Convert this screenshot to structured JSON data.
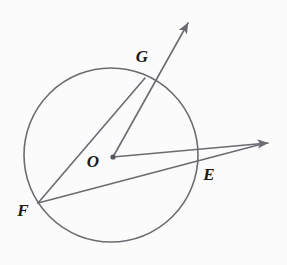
{
  "figure": {
    "kind": "geometry-diagram",
    "background_color": "#fbfbfb",
    "stroke_color": "#6b6b72",
    "label_color": "#1a1a1a",
    "width": 287,
    "height": 265
  },
  "circle": {
    "name": "circle-O",
    "center_x": 111,
    "center_y": 155,
    "radius": 87,
    "stroke_color": "#6b6b72",
    "stroke_width": 1.6,
    "fill": "none"
  },
  "points": [
    {
      "id": "O",
      "label": "O",
      "x": 113,
      "y": 157,
      "label_x": 93,
      "label_y": 161,
      "role": "center",
      "has_dot": true,
      "dot_radius": 2.6
    },
    {
      "id": "G",
      "label": "G",
      "x": 145,
      "y": 78,
      "label_x": 142,
      "label_y": 56,
      "role": "on-circle",
      "has_dot": false,
      "dot_radius": 0
    },
    {
      "id": "E",
      "label": "E",
      "x": 195,
      "y": 160,
      "label_x": 209,
      "label_y": 174,
      "role": "on-circle",
      "has_dot": false,
      "dot_radius": 0
    },
    {
      "id": "F",
      "label": "F",
      "x": 38,
      "y": 203,
      "label_x": 23,
      "label_y": 210,
      "role": "on-circle",
      "has_dot": false,
      "dot_radius": 0
    }
  ],
  "rays": [
    {
      "id": "ray-OG",
      "from": "O",
      "through": "G",
      "x1": 113,
      "y1": 157,
      "x2": 188,
      "y2": 23,
      "arrow_at_end": true,
      "stroke_width": 1.6
    },
    {
      "id": "ray-OE",
      "from": "O",
      "through": "E",
      "x1": 113,
      "y1": 157,
      "x2": 268,
      "y2": 143,
      "arrow_at_end": true,
      "stroke_width": 1.6
    }
  ],
  "segments": [
    {
      "id": "segment-FG",
      "from": "F",
      "to": "G",
      "x1": 38,
      "y1": 203,
      "x2": 145,
      "y2": 78,
      "stroke_width": 1.6
    },
    {
      "id": "segment-FE",
      "from": "F",
      "to": "E-extended",
      "x1": 38,
      "y1": 203,
      "x2": 262,
      "y2": 144,
      "stroke_width": 1.6
    }
  ],
  "arrowhead": {
    "color": "#6b6b72",
    "length": 11,
    "half_width": 4.6
  }
}
